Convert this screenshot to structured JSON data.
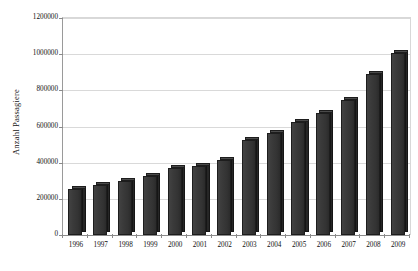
{
  "chart_data": {
    "type": "bar",
    "title": "",
    "subtitle": "",
    "xlabel": "",
    "ylabel": "Anzahl Passagiere",
    "categories": [
      "1996",
      "1997",
      "1998",
      "1999",
      "2000",
      "2001",
      "2002",
      "2003",
      "2004",
      "2005",
      "2006",
      "2007",
      "2008",
      "2009"
    ],
    "values": [
      255000,
      275000,
      300000,
      325000,
      370000,
      380000,
      415000,
      525000,
      565000,
      625000,
      675000,
      745000,
      890000,
      1005000
    ],
    "series": [
      {
        "name": "Anzahl Passagiere",
        "values": [
          255000,
          275000,
          300000,
          325000,
          370000,
          380000,
          415000,
          525000,
          565000,
          625000,
          675000,
          745000,
          890000,
          1005000
        ]
      }
    ],
    "ylim": [
      0,
      1200000
    ],
    "y_ticks": [
      0,
      200000,
      400000,
      600000,
      800000,
      1000000,
      1200000
    ],
    "y_tick_labels": [
      "0",
      "200000",
      "400000",
      "600000",
      "800000",
      "1000000",
      "1200000"
    ],
    "grid": true,
    "grid_axis": "y",
    "legend": false,
    "legend_position": "none",
    "bar_color": "#3a3a3a",
    "bar_side_color": "#262626",
    "bar_top_color": "#4a4a4a",
    "grid_color": "#d9d9d9",
    "axis_color": "#8a8a8a",
    "background_color": "#ffffff",
    "bar_style": "3d-shadow"
  }
}
